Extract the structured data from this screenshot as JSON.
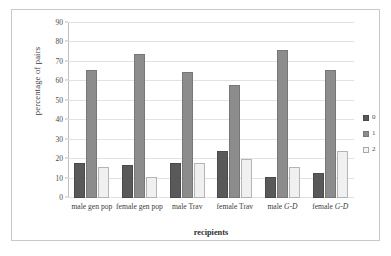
{
  "chart_data": {
    "type": "bar",
    "title": "",
    "xlabel": "recipients",
    "ylabel": "percentage of pairs",
    "ylim": [
      0,
      90
    ],
    "ytick_step": 10,
    "yticks": [
      0,
      10,
      20,
      30,
      40,
      50,
      60,
      70,
      80,
      90
    ],
    "grid": "horizontal",
    "legend_position": "right",
    "categories": [
      "male gen pop",
      "female gen pop",
      "male Trav",
      "female Trav",
      "male G-D",
      "female G-D"
    ],
    "category_parts": [
      {
        "plain": "male gen pop",
        "italic": ""
      },
      {
        "plain": "female gen pop",
        "italic": ""
      },
      {
        "plain": "male Trav",
        "italic": ""
      },
      {
        "plain": "female Trav",
        "italic": ""
      },
      {
        "plain": "male ",
        "italic": "G-D"
      },
      {
        "plain": "female ",
        "italic": "G-D"
      }
    ],
    "series": [
      {
        "name": "0",
        "color": "#595959",
        "values": [
          18,
          17,
          18,
          24,
          11,
          13
        ]
      },
      {
        "name": "1",
        "color": "#8c8c8c",
        "values": [
          66,
          74,
          65,
          58,
          76,
          66
        ]
      },
      {
        "name": "2",
        "color": "#f0f0f0",
        "values": [
          16,
          11,
          18,
          20,
          16,
          24
        ]
      }
    ]
  },
  "legend": {
    "items": [
      {
        "label": "0"
      },
      {
        "label": "1"
      },
      {
        "label": "2"
      }
    ]
  }
}
